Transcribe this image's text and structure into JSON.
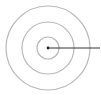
{
  "diagram": {
    "type": "concentric-circles-radius",
    "center": {
      "x": 48,
      "y": 48
    },
    "rings": [
      {
        "name": "outer",
        "radius": 42,
        "stroke": "#b8b8b8"
      },
      {
        "name": "middle",
        "radius": 26,
        "stroke": "#b8b8b8"
      },
      {
        "name": "inner",
        "radius": 11,
        "stroke": "#b8b8b8"
      }
    ],
    "radius_line": {
      "x1": 48,
      "y1": 48,
      "x2": 100,
      "y2": 48,
      "stroke": "#333333"
    },
    "center_dot": {
      "radius": 1.4,
      "fill": "#222222"
    }
  }
}
